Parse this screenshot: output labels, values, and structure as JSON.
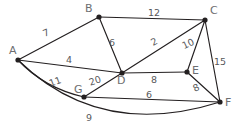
{
  "diagram": {
    "type": "node-link-graph",
    "background_color": "#ffffff",
    "edge_color": "#231f20",
    "node_color": "#231f20",
    "node_label_color": "#6d6e71",
    "weight_label_color": "#58595b"
  },
  "nodes": [
    {
      "id": "A",
      "label": "A",
      "x": 18,
      "y": 60,
      "label_x": 9,
      "label_y": 45
    },
    {
      "id": "B",
      "label": "B",
      "x": 99,
      "y": 17,
      "label_x": 85,
      "label_y": 3
    },
    {
      "id": "C",
      "label": "C",
      "x": 205,
      "y": 20,
      "label_x": 210,
      "label_y": 5
    },
    {
      "id": "D",
      "label": "D",
      "x": 122,
      "y": 73,
      "label_x": 117,
      "label_y": 75
    },
    {
      "id": "E",
      "label": "E",
      "x": 187,
      "y": 72,
      "label_x": 192,
      "label_y": 65
    },
    {
      "id": "F",
      "label": "F",
      "x": 220,
      "y": 102,
      "label_x": 225,
      "label_y": 97
    },
    {
      "id": "G",
      "label": "G",
      "x": 84,
      "y": 97,
      "label_x": 74,
      "label_y": 84
    }
  ],
  "edges": [
    {
      "id": "A-B",
      "from": "A",
      "to": "B",
      "weight": "7",
      "curved": false,
      "label_x": 43,
      "label_y": 28,
      "rotate": -23
    },
    {
      "id": "B-C",
      "from": "B",
      "to": "C",
      "weight": "12",
      "curved": false,
      "label_x": 148,
      "label_y": 8,
      "rotate": 0
    },
    {
      "id": "B-D",
      "from": "B",
      "to": "D",
      "weight": "6",
      "curved": false,
      "label_x": 109,
      "label_y": 38,
      "rotate": 0
    },
    {
      "id": "A-D",
      "from": "A",
      "to": "D",
      "weight": "4",
      "curved": false,
      "label_x": 66,
      "label_y": 55,
      "rotate": 0
    },
    {
      "id": "D-C",
      "from": "D",
      "to": "C",
      "weight": "2",
      "curved": false,
      "label_x": 151,
      "label_y": 37,
      "rotate": -28
    },
    {
      "id": "C-E",
      "from": "C",
      "to": "E",
      "weight": "10",
      "curved": false,
      "label_x": 182,
      "label_y": 39,
      "rotate": -25
    },
    {
      "id": "C-F",
      "from": "C",
      "to": "F",
      "weight": "15",
      "curved": false,
      "label_x": 214,
      "label_y": 57,
      "rotate": 0
    },
    {
      "id": "D-E",
      "from": "D",
      "to": "E",
      "weight": "8",
      "curved": false,
      "label_x": 151,
      "label_y": 75,
      "rotate": 0
    },
    {
      "id": "E-F",
      "from": "E",
      "to": "F",
      "weight": "8",
      "curved": false,
      "label_x": 193,
      "label_y": 83,
      "rotate": -25
    },
    {
      "id": "A-G",
      "from": "A",
      "to": "G",
      "weight": "11",
      "curved": true,
      "cx": 44,
      "cy": 88,
      "label_x": 49,
      "label_y": 77,
      "rotate": -20
    },
    {
      "id": "G-D",
      "from": "G",
      "to": "D",
      "weight": "20",
      "curved": false,
      "label_x": 89,
      "label_y": 76,
      "rotate": -18
    },
    {
      "id": "G-F",
      "from": "G",
      "to": "F",
      "weight": "6",
      "curved": false,
      "label_x": 146,
      "label_y": 90,
      "rotate": 0
    },
    {
      "id": "A-F",
      "from": "A",
      "to": "F",
      "weight": "9",
      "curved": true,
      "cx": 100,
      "cy": 140,
      "label_x": 86,
      "label_y": 113,
      "rotate": 0
    }
  ]
}
